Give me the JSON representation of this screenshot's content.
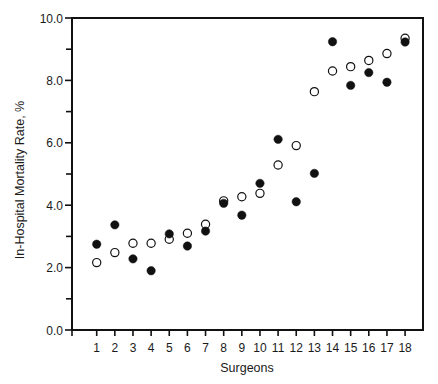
{
  "chart_data": {
    "type": "scatter",
    "title": "",
    "xlabel": "Surgeons",
    "ylabel": "In-Hospital Mortality Rate, %",
    "categories": [
      "1",
      "2",
      "3",
      "4",
      "5",
      "6",
      "7",
      "8",
      "9",
      "10",
      "11",
      "12",
      "13",
      "14",
      "15",
      "16",
      "17",
      "18"
    ],
    "x": [
      1,
      2,
      3,
      4,
      5,
      6,
      7,
      8,
      9,
      10,
      11,
      12,
      13,
      14,
      15,
      16,
      17,
      18
    ],
    "xlim": [
      0.3,
      18.9
    ],
    "ylim": [
      0,
      10
    ],
    "y_ticks": [
      0,
      2,
      4,
      6,
      8,
      10
    ],
    "y_tick_labels": [
      "0.0",
      "2.0",
      "4.0",
      "6.0",
      "8.0",
      "10.0"
    ],
    "y_minor_ticks": [
      1,
      3,
      5,
      7,
      9
    ],
    "grid": false,
    "legend": null,
    "series": [
      {
        "name": "filled",
        "marker": "filled-circle",
        "color": "#111111",
        "values": [
          2.75,
          3.37,
          2.28,
          1.9,
          3.08,
          2.69,
          3.17,
          4.06,
          3.68,
          4.7,
          6.11,
          4.11,
          5.02,
          9.24,
          7.84,
          8.25,
          7.94,
          9.23
        ]
      },
      {
        "name": "open",
        "marker": "open-circle",
        "color": "#111111",
        "values": [
          2.16,
          2.48,
          2.78,
          2.78,
          2.91,
          3.1,
          3.39,
          4.14,
          4.27,
          4.38,
          5.29,
          5.91,
          7.64,
          8.3,
          8.44,
          8.64,
          8.86,
          9.35
        ]
      }
    ]
  }
}
